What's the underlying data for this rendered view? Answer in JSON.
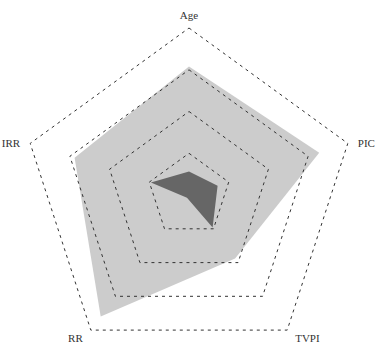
{
  "chart_data": {
    "type": "radar",
    "title": "",
    "axes": [
      "Age",
      "PIC",
      "TVPI",
      "RR",
      "IRR"
    ],
    "rings": [
      0.25,
      0.5,
      0.75,
      1.0
    ],
    "range": [
      0,
      1
    ],
    "grid": "dashed-pentagon",
    "legend": null,
    "series": [
      {
        "name": "series-1",
        "color": "#cccccc",
        "values": [
          0.77,
          0.82,
          0.47,
          0.9,
          0.72
        ]
      },
      {
        "name": "series-2",
        "color": "#666666",
        "values": [
          0.14,
          0.18,
          0.24,
          0.02,
          0.24
        ]
      }
    ]
  },
  "layout": {
    "cx": 189,
    "cy": 195,
    "radius": 167
  }
}
